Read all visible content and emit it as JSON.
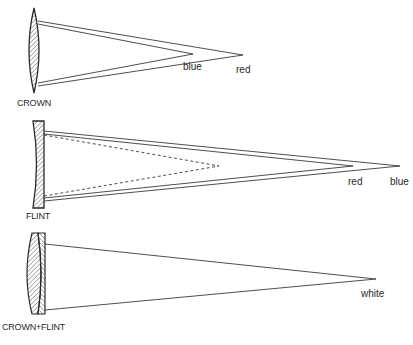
{
  "diagram": {
    "panels": [
      {
        "id": "crown",
        "lens_label": "CROWN",
        "lens_type": "converging (biconvex)",
        "focus_labels": {
          "first": "blue",
          "second": "red"
        },
        "description": "Crown lens brings blue light to a focus closer than red light"
      },
      {
        "id": "flint",
        "lens_label": "FLINT",
        "lens_type": "diverging (plano-concave)",
        "focus_labels": {
          "first": "red",
          "second": "blue"
        },
        "description": "Flint lens (dashed: virtual focus) disperses light in opposite sense; red focus nearer than blue"
      },
      {
        "id": "crown-flint",
        "lens_label": "CROWN+FLINT",
        "lens_type": "achromatic doublet",
        "focus_labels": {
          "first": "white"
        },
        "description": "Combined crown and flint lens brings all colours to a single white focus"
      }
    ],
    "colors": {
      "line": "#3a3a3a",
      "hatch": "#555555",
      "background": "#ffffff"
    }
  }
}
